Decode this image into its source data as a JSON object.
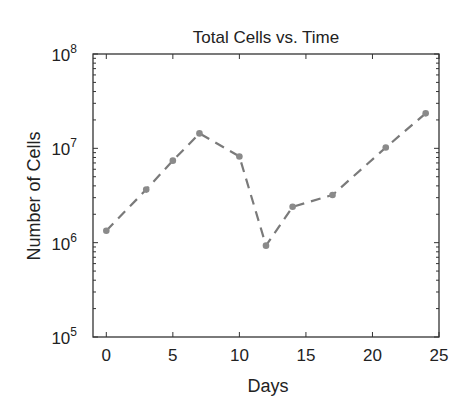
{
  "chart_data": {
    "type": "line",
    "title": "Total Cells vs. Time",
    "xlabel": "Days",
    "ylabel": "Number of Cells",
    "xlim": [
      -1,
      25
    ],
    "ylim": [
      100000,
      100000000
    ],
    "yscale": "log",
    "xticks": [
      0,
      5,
      10,
      15,
      20,
      25
    ],
    "xtick_labels": [
      "0",
      "5",
      "10",
      "15",
      "20",
      "25"
    ],
    "yticks": [
      100000,
      1000000,
      10000000,
      100000000
    ],
    "ytick_labels": [
      {
        "base": "10",
        "exp": "5"
      },
      {
        "base": "10",
        "exp": "6"
      },
      {
        "base": "10",
        "exp": "7"
      },
      {
        "base": "10",
        "exp": "8"
      }
    ],
    "grid": false,
    "legend": null,
    "series": [
      {
        "name": "Total Cells",
        "color": "#808080",
        "line_style": "dashed",
        "marker": "circle",
        "x": [
          0,
          3,
          5,
          7,
          10,
          12,
          14,
          17,
          21,
          24
        ],
        "values": [
          1340000,
          3650000,
          7400000,
          14400000,
          8200000,
          930000,
          2400000,
          3200000,
          10200000,
          23500000
        ]
      }
    ]
  }
}
